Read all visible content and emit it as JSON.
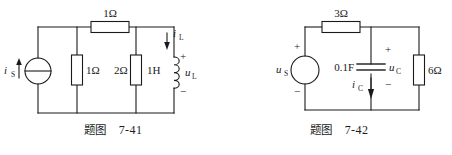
{
  "figures": [
    {
      "id": "fig-7-41",
      "caption_label": "题图",
      "caption_number": "7-41",
      "source": {
        "type": "current-source",
        "symbol": "circle-with-horizontal-bar",
        "label": "i",
        "label_sub": "S",
        "arrow_direction": "up"
      },
      "components": [
        {
          "name": "series-resistor-top",
          "value": "1Ω",
          "orientation": "horizontal"
        },
        {
          "name": "shunt-resistor-1",
          "value": "1Ω",
          "orientation": "vertical"
        },
        {
          "name": "shunt-resistor-2",
          "value": "2Ω",
          "orientation": "vertical"
        },
        {
          "name": "inductor",
          "value": "1H",
          "orientation": "vertical"
        }
      ],
      "annotations": {
        "branch_current_label": "i",
        "branch_current_sub": "L",
        "branch_current_direction": "down",
        "element_voltage_label": "u",
        "element_voltage_sub": "L",
        "polarity_plus": "+",
        "polarity_minus": "−"
      }
    },
    {
      "id": "fig-7-42",
      "caption_label": "题图",
      "caption_number": "7-42",
      "source": {
        "type": "voltage-source",
        "symbol": "plain-circle",
        "label": "u",
        "label_sub": "S",
        "polarity_plus": "+",
        "polarity_minus": "−"
      },
      "components": [
        {
          "name": "series-resistor-top",
          "value": "3Ω",
          "orientation": "horizontal"
        },
        {
          "name": "capacitor",
          "value": "0.1F",
          "orientation": "vertical"
        },
        {
          "name": "shunt-resistor",
          "value": "6Ω",
          "orientation": "vertical"
        }
      ],
      "annotations": {
        "capacitor_voltage_label": "u",
        "capacitor_voltage_sub": "C",
        "capacitor_current_label": "i",
        "capacitor_current_sub": "C",
        "capacitor_current_direction": "down",
        "polarity_plus": "+",
        "polarity_minus": "−"
      }
    }
  ],
  "style": {
    "line_color": "#1a1a1a",
    "background": "#ffffff"
  }
}
